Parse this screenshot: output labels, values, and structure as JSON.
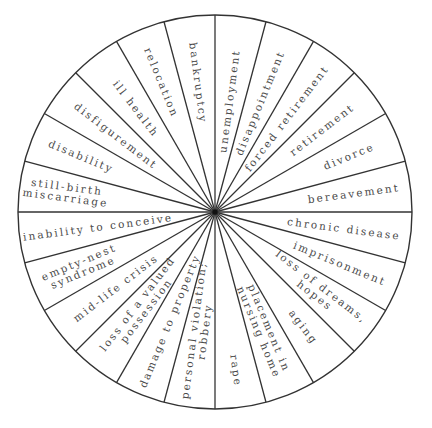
{
  "diagram": {
    "title": "",
    "type": "wheel",
    "center": [
      215,
      212
    ],
    "radius": 197,
    "wedge_count": 24,
    "stroke_color": "#333333",
    "text_color": "#4a4a4a",
    "wedges": [
      {
        "angle": 7.5,
        "lines": [
          "unemployment"
        ],
        "r_mid": 112
      },
      {
        "angle": 22.5,
        "lines": [
          "disappointment"
        ],
        "r_mid": 118
      },
      {
        "angle": 37.5,
        "lines": [
          "forced retirement"
        ],
        "r_mid": 118
      },
      {
        "angle": 52.5,
        "lines": [
          "retirement"
        ],
        "r_mid": 135
      },
      {
        "angle": 67.5,
        "lines": [
          "divorce"
        ],
        "r_mid": 145
      },
      {
        "angle": 82.5,
        "lines": [
          "bereavement"
        ],
        "r_mid": 140
      },
      {
        "angle": 97.5,
        "lines": [
          "chronic disease"
        ],
        "r_mid": 130
      },
      {
        "angle": 112.5,
        "lines": [
          "imprisonment"
        ],
        "r_mid": 135
      },
      {
        "angle": 127.5,
        "lines": [
          "loss of dreams,",
          "hopes"
        ],
        "r_mid": 130
      },
      {
        "angle": 142.5,
        "lines": [
          "aging"
        ],
        "r_mid": 145
      },
      {
        "angle": 157.5,
        "lines": [
          "placement in",
          "nursing home"
        ],
        "r_mid": 128
      },
      {
        "angle": 172.5,
        "lines": [
          "rape"
        ],
        "r_mid": 160
      },
      {
        "angle": 187.5,
        "lines": [
          "personal violation;",
          "robbery"
        ],
        "r_mid": 120
      },
      {
        "angle": 202.5,
        "lines": [
          "damage to property"
        ],
        "r_mid": 118
      },
      {
        "angle": 217.5,
        "lines": [
          "loss of a valued",
          "possession"
        ],
        "r_mid": 120
      },
      {
        "angle": 232.5,
        "lines": [
          "mid-life crisis"
        ],
        "r_mid": 125
      },
      {
        "angle": 247.5,
        "lines": [
          "empty-nest",
          "syndrome"
        ],
        "r_mid": 145
      },
      {
        "angle": 262.5,
        "lines": [
          "inability to conceive"
        ],
        "r_mid": 118
      },
      {
        "angle": 277.5,
        "lines": [
          "still-birth",
          "miscarriage"
        ],
        "r_mid": 150
      },
      {
        "angle": 292.5,
        "lines": [
          "disability"
        ],
        "r_mid": 145
      },
      {
        "angle": 307.5,
        "lines": [
          "disfigurement"
        ],
        "r_mid": 125
      },
      {
        "angle": 322.5,
        "lines": [
          "ill health"
        ],
        "r_mid": 130
      },
      {
        "angle": 337.5,
        "lines": [
          "relocation"
        ],
        "r_mid": 140
      },
      {
        "angle": 352.5,
        "lines": [
          "bankruptcy"
        ],
        "r_mid": 130
      }
    ]
  }
}
